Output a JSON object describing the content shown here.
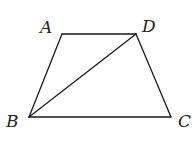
{
  "figure": {
    "type": "geometry",
    "shape": "trapezoid",
    "vertices": {
      "A": {
        "label": "A",
        "x": 62,
        "y": 34,
        "label_x": 40,
        "label_y": 33
      },
      "D": {
        "label": "D",
        "x": 136,
        "y": 34,
        "label_x": 142,
        "label_y": 32
      },
      "B": {
        "label": "B",
        "x": 29,
        "y": 117,
        "label_x": 6,
        "label_y": 127
      },
      "C": {
        "label": "C",
        "x": 171,
        "y": 117,
        "label_x": 178,
        "label_y": 127
      }
    },
    "edges": [
      {
        "name": "AD",
        "from": "A",
        "to": "D"
      },
      {
        "name": "AB",
        "from": "A",
        "to": "B"
      },
      {
        "name": "BC",
        "from": "B",
        "to": "C"
      },
      {
        "name": "DC",
        "from": "D",
        "to": "C"
      },
      {
        "name": "BD",
        "from": "B",
        "to": "D",
        "kind": "diagonal"
      }
    ],
    "colors": {
      "stroke": "#1a1a1a",
      "label": "#222222",
      "background": "#ffffff"
    }
  }
}
